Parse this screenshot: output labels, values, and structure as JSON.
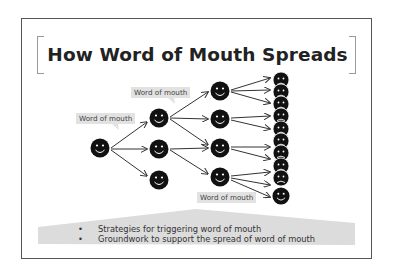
{
  "slide": {
    "title": "How Word of Mouth Spreads",
    "labels": [
      {
        "text": "Word of mouth"
      },
      {
        "text": "Word of mouth"
      },
      {
        "text": "Word of mouth"
      }
    ],
    "bullets": [
      {
        "marker": "•",
        "text": "Strategies for triggering word of mouth"
      },
      {
        "marker": "•",
        "text": "Groundwork to support the spread of word of mouth"
      }
    ],
    "diagram": {
      "columns": [
        {
          "count": 1,
          "face": "smile"
        },
        {
          "count": 3,
          "face": "smile"
        },
        {
          "count": 4,
          "face": "smile"
        },
        {
          "count": 10,
          "face": "neutral"
        }
      ]
    },
    "colors": {
      "frame": "#555555",
      "face": "#111111",
      "label_bg": "#e2e2e2",
      "band": "#dcdcdc"
    }
  }
}
